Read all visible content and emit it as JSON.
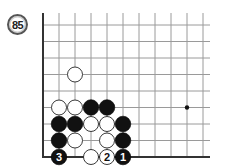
{
  "diagram": {
    "number": "85",
    "board": {
      "origin_x": 43,
      "origin_y": 157,
      "spacing_x": 16,
      "spacing_y": 16.5,
      "columns": 11,
      "rows": 9,
      "top_stub_y": 13,
      "right_end_x": 210,
      "edges": [
        "left",
        "bottom"
      ],
      "line_color": "#9a9a9a",
      "edge_color": "#333333"
    },
    "hoshi": [
      {
        "col": 9,
        "row": 3
      }
    ],
    "stones": [
      {
        "color": "white",
        "col": 2,
        "row": 5,
        "label": ""
      },
      {
        "color": "white",
        "col": 1,
        "row": 3,
        "label": ""
      },
      {
        "color": "white",
        "col": 2,
        "row": 3,
        "label": ""
      },
      {
        "color": "black",
        "col": 3,
        "row": 3,
        "label": ""
      },
      {
        "color": "black",
        "col": 4,
        "row": 3,
        "label": ""
      },
      {
        "color": "black",
        "col": 1,
        "row": 2,
        "label": ""
      },
      {
        "color": "black",
        "col": 2,
        "row": 2,
        "label": ""
      },
      {
        "color": "white",
        "col": 3,
        "row": 2,
        "label": ""
      },
      {
        "color": "white",
        "col": 4,
        "row": 2,
        "label": ""
      },
      {
        "color": "black",
        "col": 5,
        "row": 2,
        "label": ""
      },
      {
        "color": "black",
        "col": 1,
        "row": 1,
        "label": ""
      },
      {
        "color": "white",
        "col": 2,
        "row": 1,
        "label": ""
      },
      {
        "color": "white",
        "col": 4,
        "row": 1,
        "label": ""
      },
      {
        "color": "black",
        "col": 5,
        "row": 1,
        "label": ""
      },
      {
        "color": "black",
        "col": 1,
        "row": 0,
        "label": "3"
      },
      {
        "color": "white",
        "col": 3,
        "row": 0,
        "label": ""
      },
      {
        "color": "white",
        "col": 4,
        "row": 0,
        "label": "2"
      },
      {
        "color": "black",
        "col": 5,
        "row": 0,
        "label": "1"
      }
    ]
  }
}
